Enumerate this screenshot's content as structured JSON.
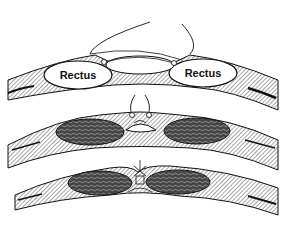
{
  "figure": {
    "panels": [
      {
        "id": "top",
        "description": "Rectus sheath separated, sutures placed",
        "labels": [
          "Rectus",
          "Rectus"
        ]
      },
      {
        "id": "middle",
        "description": "Sutures drawing rectus muscles toward midline"
      },
      {
        "id": "bottom",
        "description": "Rectus muscles approximated at midline with tied suture"
      }
    ]
  },
  "labels": {
    "left_rectus": "Rectus",
    "right_rectus": "Rectus"
  },
  "colors": {
    "ink": "#111111",
    "background": "#ffffff",
    "muscle_fill": "#3a3a3a"
  }
}
